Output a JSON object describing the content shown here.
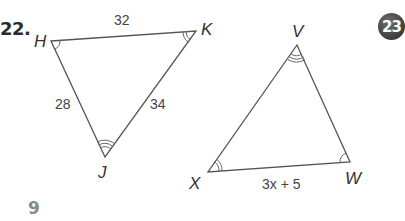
{
  "problem": {
    "number_label": "22.",
    "page_number": "9",
    "badge_label": "23"
  },
  "triangle_hkj": {
    "vertices": {
      "H": "H",
      "K": "K",
      "J": "J"
    },
    "sides": {
      "HK": "32",
      "HJ": "28",
      "KJ": "34"
    },
    "angle_marks": {
      "H": 1,
      "K": 2,
      "J": 3
    }
  },
  "triangle_vxw": {
    "vertices": {
      "V": "V",
      "X": "X",
      "W": "W"
    },
    "sides": {
      "XW": "3x + 5"
    },
    "angle_marks": {
      "V": 3,
      "X": 2,
      "W": 1
    }
  },
  "colors": {
    "line": "#555555",
    "text": "#333333",
    "badge_bg": "#4a4a4a",
    "page_num": "#8a8a8a"
  }
}
